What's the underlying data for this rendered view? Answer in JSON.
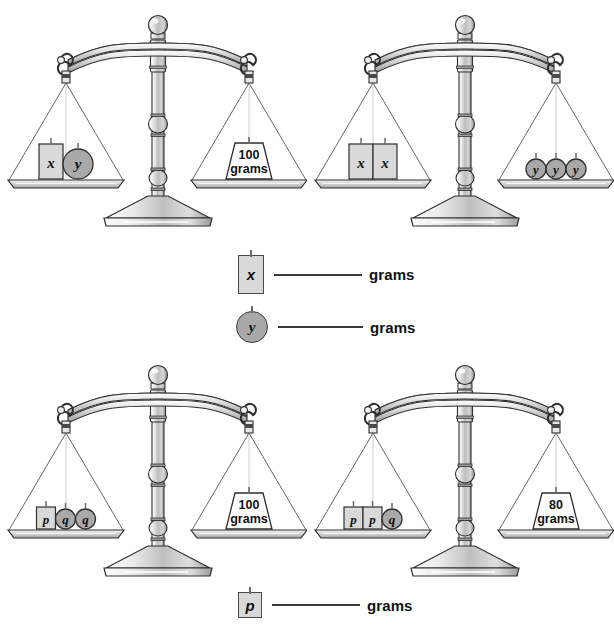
{
  "page": {
    "unit_label": "grams"
  },
  "scales": [
    {
      "id": "scale-top-left",
      "position": {
        "x": 0,
        "y": 0
      },
      "left_pan": {
        "items": [
          {
            "shape": "rect",
            "label": "x"
          },
          {
            "shape": "circle",
            "label": "y"
          }
        ]
      },
      "right_pan": {
        "items": [
          {
            "shape": "weight",
            "value": "100",
            "unit": "grams"
          }
        ]
      }
    },
    {
      "id": "scale-top-right",
      "position": {
        "x": 307,
        "y": 0
      },
      "left_pan": {
        "items": [
          {
            "shape": "rect",
            "label": "x"
          },
          {
            "shape": "rect",
            "label": "x"
          }
        ]
      },
      "right_pan": {
        "items": [
          {
            "shape": "circle",
            "label": "y"
          },
          {
            "shape": "circle",
            "label": "y"
          },
          {
            "shape": "circle",
            "label": "y"
          }
        ]
      }
    },
    {
      "id": "scale-bottom-left",
      "position": {
        "x": 0,
        "y": 350
      },
      "left_pan": {
        "items": [
          {
            "shape": "rect",
            "label": "p"
          },
          {
            "shape": "circle",
            "label": "q"
          },
          {
            "shape": "circle",
            "label": "q"
          }
        ]
      },
      "right_pan": {
        "items": [
          {
            "shape": "weight",
            "value": "100",
            "unit": "grams"
          }
        ]
      }
    },
    {
      "id": "scale-bottom-right",
      "position": {
        "x": 307,
        "y": 350
      },
      "left_pan": {
        "items": [
          {
            "shape": "rect",
            "label": "p"
          },
          {
            "shape": "rect",
            "label": "p"
          },
          {
            "shape": "circle",
            "label": "q"
          }
        ]
      },
      "right_pan": {
        "items": [
          {
            "shape": "weight",
            "value": "80",
            "unit": "grams"
          }
        ]
      }
    }
  ],
  "answers": [
    {
      "id": "answer-x",
      "symbol": "x",
      "shape": "rect",
      "blank": "",
      "unit": "grams"
    },
    {
      "id": "answer-y",
      "symbol": "y",
      "shape": "circle",
      "blank": "",
      "unit": "grams"
    },
    {
      "id": "answer-p",
      "symbol": "p",
      "shape": "rect",
      "blank": "",
      "unit": "grams"
    }
  ],
  "colors": {
    "outline": "#2e2e2e",
    "metal_light": "#f0f0f0",
    "metal_mid": "#c9c9c9",
    "metal_dark": "#8e8e8e",
    "block_fill": "#d9d9d9",
    "circle_fill": "#a9a9a9",
    "weight_fill": "#ffffff"
  }
}
